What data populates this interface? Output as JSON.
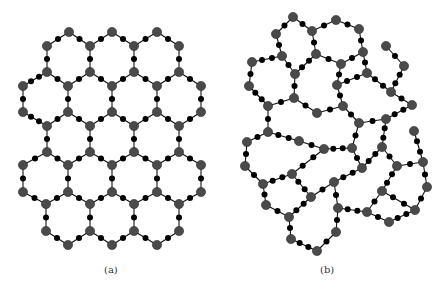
{
  "figure": {
    "colors": {
      "background": "#ffffff",
      "edge": "#111111",
      "major_node": "#4a4a4a",
      "minor_node": "#000000"
    },
    "node_sizes": {
      "major_radius": 4.6,
      "minor_radius": 3.0,
      "edge_width": 1.1
    },
    "panels": [
      {
        "id": "a",
        "label": "(a)",
        "description": "ordered honeycomb lattice",
        "nodes": {
          "r1t1": [
            69,
            32
          ],
          "r1t2": [
            112,
            32
          ],
          "r1t3": [
            157,
            32
          ],
          "v47a": [
            47,
            46
          ],
          "v90a": [
            90,
            46
          ],
          "v134a": [
            134,
            46
          ],
          "v179a": [
            179,
            46
          ],
          "v47b": [
            47,
            72
          ],
          "v90b": [
            90,
            72
          ],
          "v134b": [
            134,
            72
          ],
          "v179b": [
            179,
            72
          ],
          "h23a": [
            23,
            86
          ],
          "h68a": [
            68,
            86
          ],
          "h112a": [
            112,
            86
          ],
          "h157a": [
            157,
            86
          ],
          "h201a": [
            201,
            86
          ],
          "h23b": [
            23,
            112
          ],
          "h68b": [
            68,
            112
          ],
          "h112b": [
            112,
            112
          ],
          "h157b": [
            157,
            112
          ],
          "h201b": [
            201,
            112
          ],
          "v47c": [
            47,
            126
          ],
          "v90c": [
            90,
            126
          ],
          "v134c": [
            134,
            126
          ],
          "v179c": [
            179,
            126
          ],
          "v47d": [
            47,
            152
          ],
          "v90d": [
            90,
            152
          ],
          "v134d": [
            134,
            152
          ],
          "v179d": [
            179,
            152
          ],
          "h23c": [
            23,
            165
          ],
          "h68c": [
            68,
            165
          ],
          "h112c": [
            112,
            165
          ],
          "h157c": [
            157,
            165
          ],
          "h201c": [
            201,
            165
          ],
          "h23d": [
            23,
            192
          ],
          "h68d": [
            68,
            192
          ],
          "h112d": [
            112,
            192
          ],
          "h157d": [
            157,
            192
          ],
          "h201d": [
            201,
            192
          ],
          "v47e": [
            46,
            204
          ],
          "v90e": [
            90,
            204
          ],
          "v134e": [
            134,
            204
          ],
          "v179e": [
            179,
            204
          ],
          "v47f": [
            46,
            231
          ],
          "v90f": [
            90,
            231
          ],
          "v134f": [
            134,
            231
          ],
          "v179f": [
            179,
            231
          ],
          "b68": [
            68,
            245
          ],
          "b112": [
            112,
            245
          ],
          "b157": [
            157,
            245
          ]
        },
        "edges": [
          [
            "r1t1",
            "v47a"
          ],
          [
            "r1t1",
            "v90a"
          ],
          [
            "r1t2",
            "v90a"
          ],
          [
            "r1t2",
            "v134a"
          ],
          [
            "r1t3",
            "v134a"
          ],
          [
            "r1t3",
            "v179a"
          ],
          [
            "v47a",
            "v47b"
          ],
          [
            "v90a",
            "v90b"
          ],
          [
            "v134a",
            "v134b"
          ],
          [
            "v179a",
            "v179b"
          ],
          [
            "v47b",
            "h23a"
          ],
          [
            "v47b",
            "h68a"
          ],
          [
            "v90b",
            "h68a"
          ],
          [
            "v90b",
            "h112a"
          ],
          [
            "v134b",
            "h112a"
          ],
          [
            "v134b",
            "h157a"
          ],
          [
            "v179b",
            "h157a"
          ],
          [
            "v179b",
            "h201a"
          ],
          [
            "h23a",
            "h23b"
          ],
          [
            "h68a",
            "h68b"
          ],
          [
            "h112a",
            "h112b"
          ],
          [
            "h157a",
            "h157b"
          ],
          [
            "h201a",
            "h201b"
          ],
          [
            "h23b",
            "v47c"
          ],
          [
            "h68b",
            "v47c"
          ],
          [
            "h68b",
            "v90c"
          ],
          [
            "h112b",
            "v90c"
          ],
          [
            "h112b",
            "v134c"
          ],
          [
            "h157b",
            "v134c"
          ],
          [
            "h157b",
            "v179c"
          ],
          [
            "h201b",
            "v179c"
          ],
          [
            "v47c",
            "v47d"
          ],
          [
            "v90c",
            "v90d"
          ],
          [
            "v134c",
            "v134d"
          ],
          [
            "v179c",
            "v179d"
          ],
          [
            "v47d",
            "h23c"
          ],
          [
            "v47d",
            "h68c"
          ],
          [
            "v90d",
            "h68c"
          ],
          [
            "v90d",
            "h112c"
          ],
          [
            "v134d",
            "h112c"
          ],
          [
            "v134d",
            "h157c"
          ],
          [
            "v179d",
            "h157c"
          ],
          [
            "v179d",
            "h201c"
          ],
          [
            "h23c",
            "h23d"
          ],
          [
            "h68c",
            "h68d"
          ],
          [
            "h112c",
            "h112d"
          ],
          [
            "h157c",
            "h157d"
          ],
          [
            "h201c",
            "h201d"
          ],
          [
            "h23d",
            "v47e"
          ],
          [
            "h68d",
            "v47e"
          ],
          [
            "h68d",
            "v90e"
          ],
          [
            "h112d",
            "v90e"
          ],
          [
            "h112d",
            "v134e"
          ],
          [
            "h157d",
            "v134e"
          ],
          [
            "h157d",
            "v179e"
          ],
          [
            "h201d",
            "v179e"
          ],
          [
            "v47e",
            "v47f"
          ],
          [
            "v90e",
            "v90f"
          ],
          [
            "v134e",
            "v134f"
          ],
          [
            "v179e",
            "v179f"
          ],
          [
            "v47f",
            "b68"
          ],
          [
            "v90f",
            "b68"
          ],
          [
            "v90f",
            "b112"
          ],
          [
            "v134f",
            "b112"
          ],
          [
            "v134f",
            "b157"
          ],
          [
            "v179f",
            "b157"
          ]
        ]
      },
      {
        "id": "b",
        "label": "(b)",
        "description": "disordered network",
        "nodes": {
          "A": [
            293,
            17
          ],
          "B": [
            276,
            34
          ],
          "C": [
            312,
            31
          ],
          "D": [
            336,
            20
          ],
          "K": [
            359,
            29
          ],
          "E": [
            282,
            56
          ],
          "F": [
            316,
            54
          ],
          "H": [
            252,
            62
          ],
          "G": [
            295,
            74
          ],
          "I": [
            249,
            86
          ],
          "L": [
            363,
            52
          ],
          "M": [
            341,
            64
          ],
          "N": [
            367,
            73
          ],
          "O": [
            337,
            85
          ],
          "Q": [
            386,
            46
          ],
          "R": [
            404,
            66
          ],
          "S": [
            391,
            92
          ],
          "T": [
            412,
            105
          ],
          "V": [
            294,
            98
          ],
          "U": [
            268,
            106
          ],
          "W": [
            317,
            113
          ],
          "P": [
            343,
            106
          ],
          "AF": [
            359,
            123
          ],
          "AG": [
            386,
            119
          ],
          "AH": [
            414,
            131
          ],
          "Z": [
            268,
            132
          ],
          "AA": [
            299,
            141
          ],
          "AB": [
            247,
            142
          ],
          "AC": [
            324,
            149
          ],
          "AI": [
            352,
            148
          ],
          "AJ": [
            382,
            147
          ],
          "AM": [
            423,
            162
          ],
          "AD": [
            245,
            166
          ],
          "AE": [
            292,
            174
          ],
          "AK": [
            362,
            168
          ],
          "AL": [
            397,
            166
          ],
          "AN": [
            334,
            182
          ],
          "AQ": [
            263,
            184
          ],
          "AP": [
            427,
            187
          ],
          "AY": [
            382,
            191
          ],
          "AR": [
            311,
            197
          ],
          "AS": [
            266,
            205
          ],
          "AU": [
            338,
            208
          ],
          "BB": [
            415,
            210
          ],
          "AZ": [
            367,
            212
          ],
          "AT": [
            289,
            217
          ],
          "BA": [
            389,
            222
          ],
          "AW": [
            336,
            232
          ],
          "AV": [
            291,
            239
          ],
          "AX": [
            317,
            251
          ]
        },
        "edges": [
          [
            "A",
            "B"
          ],
          [
            "A",
            "C"
          ],
          [
            "C",
            "D"
          ],
          [
            "D",
            "K"
          ],
          [
            "K",
            "L"
          ],
          [
            "B",
            "E"
          ],
          [
            "C",
            "F"
          ],
          [
            "E",
            "G"
          ],
          [
            "F",
            "G"
          ],
          [
            "E",
            "H"
          ],
          [
            "H",
            "I"
          ],
          [
            "F",
            "M"
          ],
          [
            "L",
            "M"
          ],
          [
            "L",
            "N"
          ],
          [
            "M",
            "O"
          ],
          [
            "N",
            "O"
          ],
          [
            "O",
            "P"
          ],
          [
            "Q",
            "R"
          ],
          [
            "R",
            "S"
          ],
          [
            "N",
            "S"
          ],
          [
            "S",
            "T"
          ],
          [
            "G",
            "V"
          ],
          [
            "I",
            "U"
          ],
          [
            "U",
            "V"
          ],
          [
            "V",
            "W"
          ],
          [
            "W",
            "P"
          ],
          [
            "P",
            "AF"
          ],
          [
            "AF",
            "AG"
          ],
          [
            "T",
            "AG"
          ],
          [
            "AF",
            "AI"
          ],
          [
            "AI",
            "AC"
          ],
          [
            "AI",
            "AK"
          ],
          [
            "AK",
            "AJ"
          ],
          [
            "AG",
            "AJ"
          ],
          [
            "AJ",
            "AL"
          ],
          [
            "AL",
            "AM"
          ],
          [
            "AH",
            "AM"
          ],
          [
            "AM",
            "AP"
          ],
          [
            "AL",
            "AY"
          ],
          [
            "AK",
            "AN"
          ],
          [
            "U",
            "Z"
          ],
          [
            "Z",
            "AA"
          ],
          [
            "Z",
            "AB"
          ],
          [
            "AA",
            "AC"
          ],
          [
            "AC",
            "AE"
          ],
          [
            "AB",
            "AD"
          ],
          [
            "AD",
            "AQ"
          ],
          [
            "AQ",
            "AE"
          ],
          [
            "AE",
            "AR"
          ],
          [
            "AR",
            "AN"
          ],
          [
            "AN",
            "AU"
          ],
          [
            "AQ",
            "AS"
          ],
          [
            "AS",
            "AT"
          ],
          [
            "AT",
            "AR"
          ],
          [
            "AT",
            "AV"
          ],
          [
            "AV",
            "AX"
          ],
          [
            "AX",
            "AW"
          ],
          [
            "AW",
            "AU"
          ],
          [
            "AY",
            "AZ"
          ],
          [
            "AY",
            "BB"
          ],
          [
            "AZ",
            "AU"
          ],
          [
            "AZ",
            "BA"
          ],
          [
            "BA",
            "BB"
          ],
          [
            "BB",
            "AP"
          ]
        ]
      }
    ]
  }
}
